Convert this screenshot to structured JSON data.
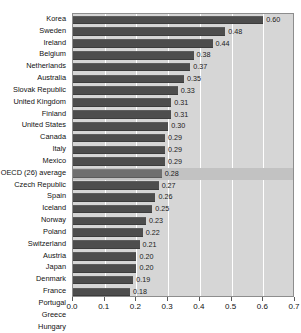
{
  "chart_data": {
    "type": "bar",
    "orientation": "horizontal",
    "title": "",
    "xlabel": "",
    "ylabel": "",
    "xlim": [
      0.0,
      0.7
    ],
    "xticks": [
      "0.0",
      "0.1",
      "0.2",
      "0.3",
      "0.4",
      "0.5",
      "0.6",
      "0.7"
    ],
    "xtick_values": [
      0.0,
      0.1,
      0.2,
      0.3,
      0.4,
      0.5,
      0.6,
      0.7
    ],
    "grid": true,
    "gridlines": "vertical-white",
    "legend": null,
    "categories": [
      "Korea",
      "Sweden",
      "Ireland",
      "Belgium",
      "Netherlands",
      "Australia",
      "Slovak Republic",
      "United Kingdom",
      "Finland",
      "United States",
      "Canada",
      "Italy",
      "Mexico",
      "OECD (26) average",
      "Czech Republic",
      "Spain",
      "Iceland",
      "Norway",
      "Poland",
      "Switzerland",
      "Austria",
      "Japan",
      "Denmark",
      "France",
      "Portugal",
      "Greece",
      "Hungary"
    ],
    "values": [
      0.6,
      0.48,
      0.44,
      0.38,
      0.37,
      0.35,
      0.33,
      0.31,
      0.31,
      0.3,
      0.29,
      0.29,
      0.29,
      0.28,
      0.27,
      0.26,
      0.25,
      0.23,
      0.22,
      0.21,
      0.2,
      0.2,
      0.19,
      0.18,
      0.17,
      0.11,
      0.11
    ],
    "value_labels": [
      "0.60",
      "0.48",
      "0.44",
      "0.38",
      "0.37",
      "0.35",
      "0.33",
      "0.31",
      "0.31",
      "0.30",
      "0.29",
      "0.29",
      "0.29",
      "0.28",
      "0.27",
      "0.26",
      "0.25",
      "0.23",
      "0.22",
      "0.21",
      "0.20",
      "0.20",
      "0.19",
      "0.18",
      "0.17",
      "0.11",
      "0.11"
    ],
    "highlight_index": 13,
    "colors": {
      "bar": "#4d4d4d",
      "bar_highlight": "#6f6f6f",
      "panel_background": "#d6d6d6",
      "row_highlight": "#c2c2c2",
      "gridline": "#ffffff",
      "axis": "#5a5a5a",
      "text": "#111111"
    }
  }
}
